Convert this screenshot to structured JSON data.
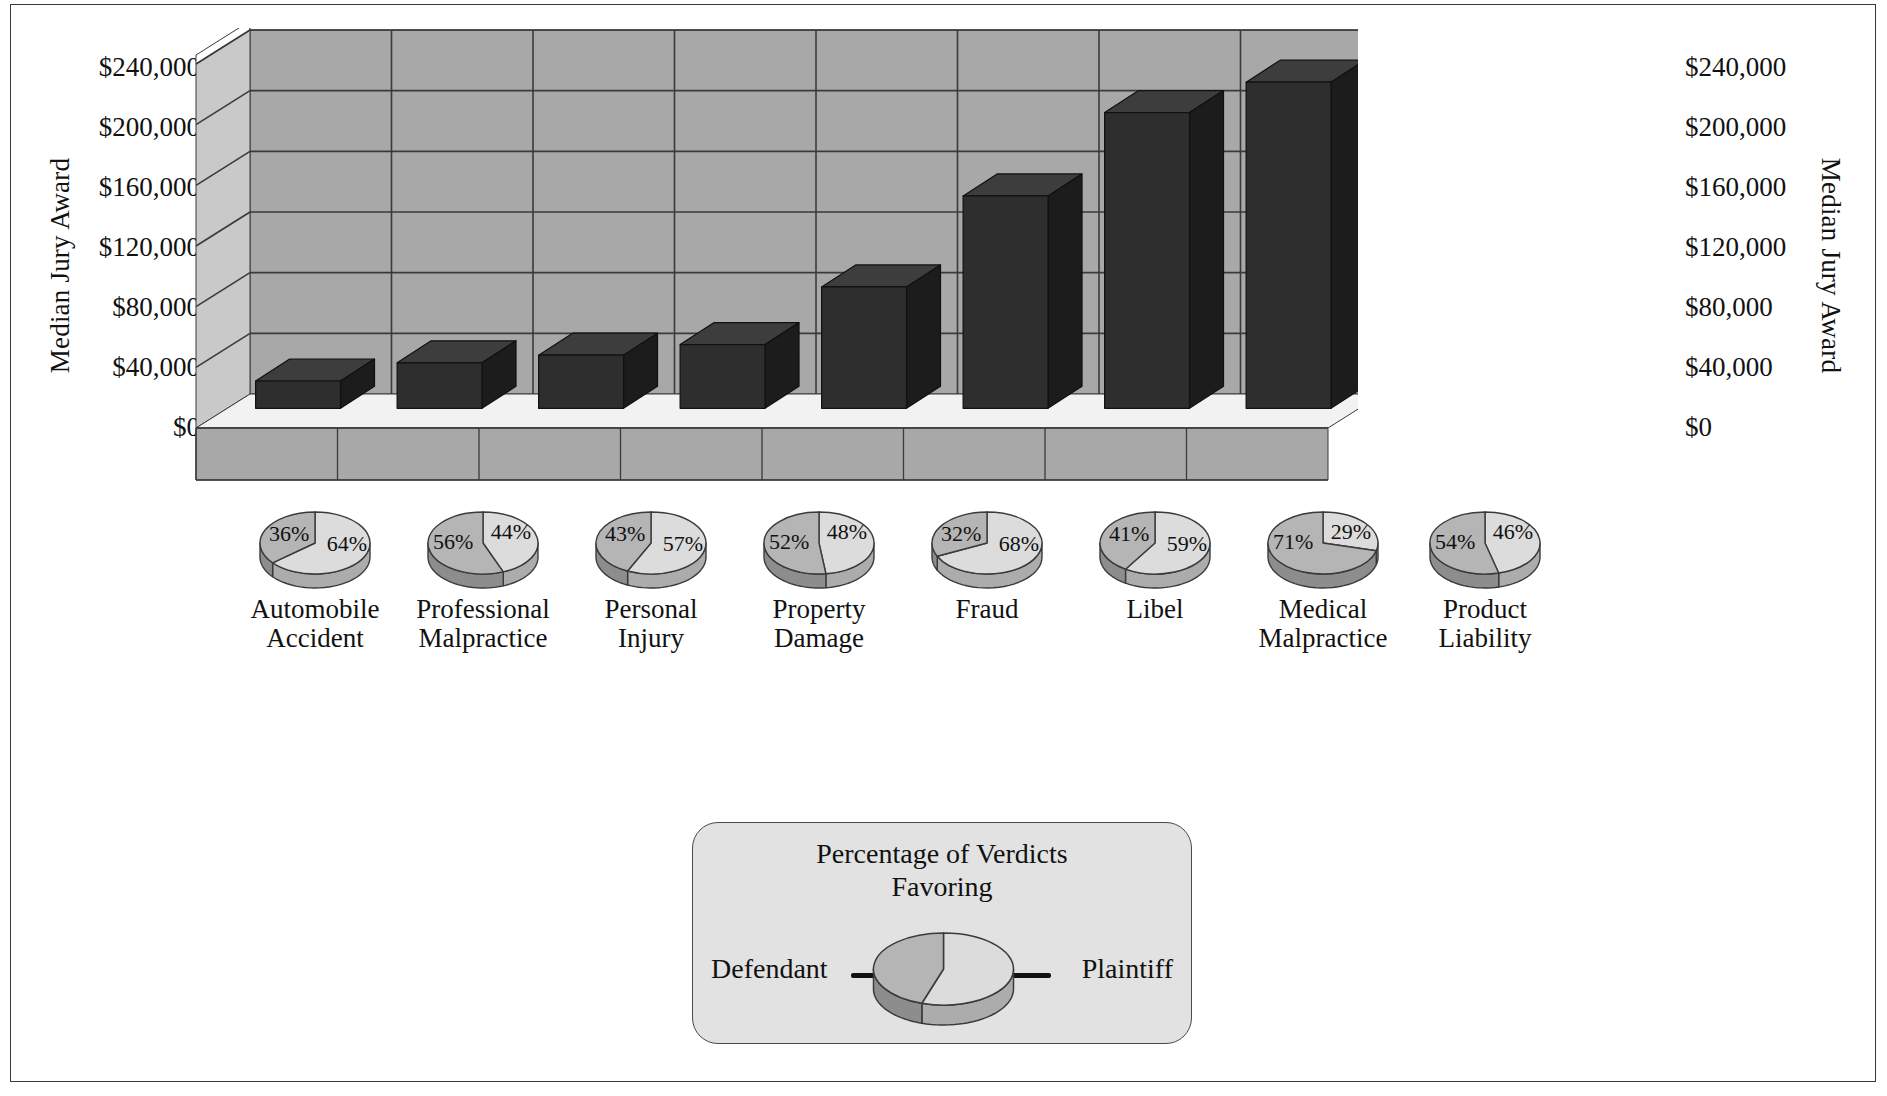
{
  "axis": {
    "y_label_left": "Median Jury Award",
    "y_label_right": "Median Jury Award",
    "ticks": [
      "$240,000",
      "$200,000",
      "$160,000",
      "$120,000",
      "$80,000",
      "$40,000",
      "$0"
    ]
  },
  "legend": {
    "title_line1": "Percentage of Verdicts",
    "title_line2": "Favoring",
    "defendant_label": "Defendant",
    "plaintiff_label": "Plaintiff"
  },
  "colors": {
    "bar_front": "#2e2e2e",
    "bar_top": "#3d3d3d",
    "bar_side": "#1c1c1c",
    "wall_back": "#a8a8a8",
    "wall_left": "#c9c9c9",
    "floor_top": "#f2f2f2",
    "floor_front": "#a8a8a8",
    "grid_line": "#3a3a3a",
    "pie_defendant": "#b5b5b5",
    "pie_plaintiff": "#dcdcdc",
    "pie_edge": "#3a3a3a",
    "legend_bg": "#e2e2e2"
  },
  "chart_data": {
    "type": "bar",
    "title": "",
    "xlabel": "",
    "ylabel": "Median Jury Award",
    "ylim": [
      0,
      240000
    ],
    "ytick_values": [
      0,
      40000,
      80000,
      120000,
      160000,
      200000,
      240000
    ],
    "ytick_labels": [
      "$0",
      "$40,000",
      "$80,000",
      "$120,000",
      "$160,000",
      "$200,000",
      "$240,000"
    ],
    "grid": true,
    "legend_position": "bottom-center",
    "categories": [
      "Automobile Accident",
      "Professional Malpractice",
      "Personal Injury",
      "Property Damage",
      "Fraud",
      "Libel",
      "Medical Malpractice",
      "Product Liability"
    ],
    "category_lines": [
      [
        "Automobile",
        "Accident"
      ],
      [
        "Professional",
        "Malpractice"
      ],
      [
        "Personal",
        "Injury"
      ],
      [
        "Property",
        "Damage"
      ],
      [
        "Fraud",
        ""
      ],
      [
        "Libel",
        ""
      ],
      [
        "Medical",
        "Malpractice"
      ],
      [
        "Product",
        "Liability"
      ]
    ],
    "values": [
      18000,
      30000,
      35000,
      42000,
      80000,
      140000,
      195000,
      215000
    ],
    "series": [
      {
        "name": "Median Jury Award",
        "values": [
          18000,
          30000,
          35000,
          42000,
          80000,
          140000,
          195000,
          215000
        ]
      }
    ]
  },
  "pies": {
    "type": "pie",
    "slice_names": [
      "Defendant",
      "Plaintiff"
    ],
    "items": [
      {
        "category": "Automobile Accident",
        "defendant": 36,
        "plaintiff": 64,
        "defendant_label": "36%",
        "plaintiff_label": "64%"
      },
      {
        "category": "Professional Malpractice",
        "defendant": 56,
        "plaintiff": 44,
        "defendant_label": "56%",
        "plaintiff_label": "44%"
      },
      {
        "category": "Personal Injury",
        "defendant": 43,
        "plaintiff": 57,
        "defendant_label": "43%",
        "plaintiff_label": "57%"
      },
      {
        "category": "Property Damage",
        "defendant": 52,
        "plaintiff": 48,
        "defendant_label": "52%",
        "plaintiff_label": "48%"
      },
      {
        "category": "Fraud",
        "defendant": 32,
        "plaintiff": 68,
        "defendant_label": "32%",
        "plaintiff_label": "68%"
      },
      {
        "category": "Libel",
        "defendant": 41,
        "plaintiff": 59,
        "defendant_label": "41%",
        "plaintiff_label": "59%"
      },
      {
        "category": "Medical Malpractice",
        "defendant": 71,
        "plaintiff": 29,
        "defendant_label": "71%",
        "plaintiff_label": "29%"
      },
      {
        "category": "Product Liability",
        "defendant": 54,
        "plaintiff": 46,
        "defendant_label": "54%",
        "plaintiff_label": "46%"
      }
    ]
  }
}
